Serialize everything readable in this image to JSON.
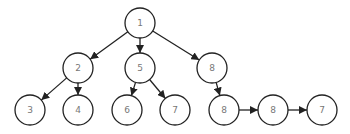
{
  "diagram": {
    "type": "tree",
    "colors": {
      "stroke": "#222222",
      "label": "#777777",
      "fill": "#ffffff"
    },
    "nodes": [
      {
        "id": "n1",
        "label": "1"
      },
      {
        "id": "n2",
        "label": "2"
      },
      {
        "id": "n5",
        "label": "5"
      },
      {
        "id": "n8a",
        "label": "8"
      },
      {
        "id": "n3",
        "label": "3"
      },
      {
        "id": "n4",
        "label": "4"
      },
      {
        "id": "n6",
        "label": "6"
      },
      {
        "id": "n7a",
        "label": "7"
      },
      {
        "id": "n8b",
        "label": "8"
      },
      {
        "id": "n8c",
        "label": "8"
      },
      {
        "id": "n7b",
        "label": "7"
      }
    ],
    "edges": [
      {
        "from": "n1",
        "to": "n2"
      },
      {
        "from": "n1",
        "to": "n5"
      },
      {
        "from": "n1",
        "to": "n8a"
      },
      {
        "from": "n2",
        "to": "n3"
      },
      {
        "from": "n2",
        "to": "n4"
      },
      {
        "from": "n5",
        "to": "n6"
      },
      {
        "from": "n5",
        "to": "n7a"
      },
      {
        "from": "n8a",
        "to": "n8b"
      },
      {
        "from": "n8b",
        "to": "n8c"
      },
      {
        "from": "n8c",
        "to": "n7b"
      }
    ]
  }
}
